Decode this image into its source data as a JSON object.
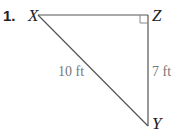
{
  "problem": {
    "number": "1.",
    "vertices": {
      "x": "X",
      "y": "Y",
      "z": "Z"
    },
    "right_angle_at": "Z",
    "sides": {
      "hypotenuse_xy": "10 ft",
      "leg_zy": "7 ft"
    }
  },
  "colors": {
    "line": "#444444",
    "label": "#777777",
    "text": "#222222"
  }
}
